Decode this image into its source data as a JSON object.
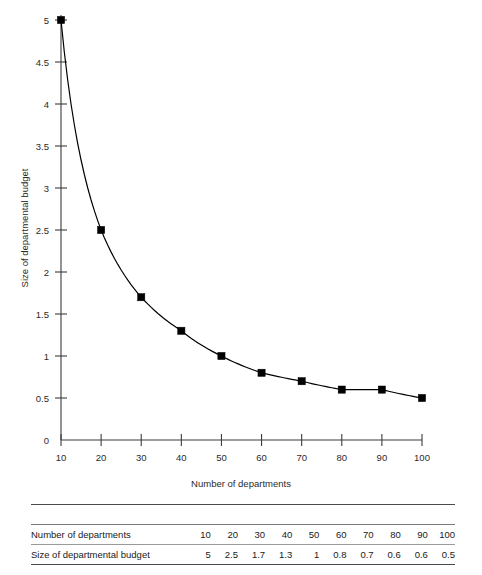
{
  "chart_data": {
    "type": "line",
    "title": "",
    "xlabel": "Number of departments",
    "ylabel": "Size of departmental budget",
    "x": [
      10,
      20,
      30,
      40,
      50,
      60,
      70,
      80,
      90,
      100
    ],
    "values": [
      5,
      2.5,
      1.7,
      1.3,
      1,
      0.8,
      0.7,
      0.6,
      0.6,
      0.5
    ],
    "series": [
      {
        "name": "Size of departmental budget",
        "values": [
          5,
          2.5,
          1.7,
          1.3,
          1,
          0.8,
          0.7,
          0.6,
          0.6,
          0.5
        ]
      }
    ],
    "xlim": [
      10,
      100
    ],
    "ylim": [
      0,
      5
    ],
    "xticks": [
      10,
      20,
      30,
      40,
      50,
      60,
      70,
      80,
      90,
      100
    ],
    "xtick_labels": [
      "10",
      "20",
      "30",
      "40",
      "50",
      "60",
      "70",
      "80",
      "90",
      "100"
    ],
    "yticks": [
      0,
      0.5,
      1,
      1.5,
      2,
      2.5,
      3,
      3.5,
      4,
      4.5,
      5
    ],
    "ytick_labels": [
      "0",
      "0.5",
      "1",
      "1.5",
      "2",
      "2.5",
      "3",
      "3.5",
      "4",
      "4.5",
      "5"
    ],
    "grid": false,
    "legend": false,
    "legend_position": "none",
    "marker": "square",
    "marker_color": "#000000",
    "line_color": "#000000",
    "axis_color": "#3b3b3b",
    "background": "#ffffff"
  },
  "table": {
    "rows": [
      {
        "label": "Number of departments",
        "values": [
          "10",
          "20",
          "30",
          "40",
          "50",
          "60",
          "70",
          "80",
          "90",
          "100"
        ]
      },
      {
        "label": "Size of departmental budget",
        "values": [
          "5",
          "2.5",
          "1.7",
          "1.3",
          "1",
          "0.8",
          "0.7",
          "0.6",
          "0.6",
          "0.5"
        ]
      }
    ]
  }
}
